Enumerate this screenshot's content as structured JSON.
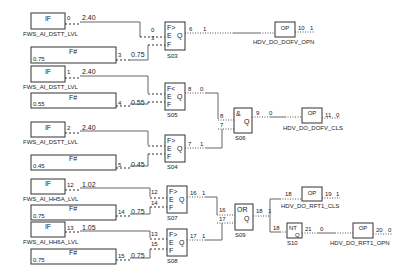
{
  "diagram": {
    "type": "function-block-logic",
    "inputs": [
      {
        "id": "in-if-0",
        "type": "IF",
        "tag": "FWS_AI_DSTT_LVL",
        "signal": "0",
        "value": "2.40"
      },
      {
        "id": "in-fs-3",
        "type": "F#",
        "constant": "0.75",
        "signal": "3",
        "value": "0.75"
      },
      {
        "id": "in-if-1",
        "type": "IF",
        "tag": "FWS_AI_DSTT_LVL",
        "signal": "1",
        "value": "2.40"
      },
      {
        "id": "in-fs-4",
        "type": "F#",
        "constant": "0.55",
        "signal": "4",
        "value": "0.55"
      },
      {
        "id": "in-if-2",
        "type": "IF",
        "tag": "FWS_AI_DSTT_LVL",
        "signal": "2",
        "value": "2.40"
      },
      {
        "id": "in-fs-5",
        "type": "F#",
        "constant": "0.45",
        "signal": "5",
        "value": "0.45"
      },
      {
        "id": "in-if-12",
        "type": "IF",
        "tag": "FWS_AI_HH5A_LVL",
        "signal": "12",
        "value": "1.02"
      },
      {
        "id": "in-fs-14",
        "type": "F#",
        "constant": "0.75",
        "signal": "14",
        "value": "0.75"
      },
      {
        "id": "in-if-13",
        "type": "IF",
        "tag": "FWS_AI_HH6A_LVL",
        "signal": "13",
        "value": "1.05"
      },
      {
        "id": "in-fs-15",
        "type": "F#",
        "constant": "0.75",
        "signal": "15",
        "value": "0.75"
      }
    ],
    "blocks": [
      {
        "id": "S03",
        "label": "S03",
        "lines": [
          "F>",
          "E",
          "F"
        ],
        "q": "Q",
        "in_signals": [
          "0",
          "3"
        ],
        "out_signal": "6",
        "out_value": "1"
      },
      {
        "id": "S05",
        "label": "S05",
        "lines": [
          "F<",
          "E",
          "F"
        ],
        "q": "Q",
        "in_signals": [
          "1",
          "4"
        ],
        "out_signal": "8",
        "out_value": "0"
      },
      {
        "id": "S04",
        "label": "S04",
        "lines": [
          "F>",
          "E",
          "F"
        ],
        "q": "Q",
        "in_signals": [
          "2",
          "5"
        ],
        "out_signal": "7",
        "out_value": "1"
      },
      {
        "id": "S06",
        "label": "S06",
        "lines": [
          "&"
        ],
        "q": "Q",
        "in_signals": [
          "8",
          "7"
        ],
        "out_signal": "9",
        "out_value": "0"
      },
      {
        "id": "S07",
        "label": "S07",
        "lines": [
          "F>",
          "E",
          "F"
        ],
        "q": "Q",
        "in_signals": [
          "12",
          "14"
        ],
        "out_signal": "16",
        "out_value": "1"
      },
      {
        "id": "S08",
        "label": "S08",
        "lines": [
          "F>",
          "E",
          "F"
        ],
        "q": "Q",
        "in_signals": [
          "13",
          "15"
        ],
        "out_signal": "17",
        "out_value": "1"
      },
      {
        "id": "S09",
        "label": "S09",
        "lines": [
          "OR"
        ],
        "q": "Q",
        "in_signals": [
          "16",
          "17"
        ],
        "out_signal": "18",
        "out_value": "1"
      },
      {
        "id": "S10",
        "label": "S10",
        "lines": [
          "NT"
        ],
        "q": "Q",
        "in_signals": [
          "18"
        ],
        "out_signal": "21",
        "out_value": "0"
      }
    ],
    "outputs": [
      {
        "id": "out-10",
        "type": "OP",
        "tag": "HDV_DO_DOFV_OPN",
        "in_signal": "6",
        "signal": "10",
        "value": "1"
      },
      {
        "id": "out-11",
        "type": "OP",
        "tag": "HDV_DO_DOFV_CLS",
        "in_signal": "9",
        "signal": "11",
        "value": "0"
      },
      {
        "id": "out-19",
        "type": "OP",
        "tag": "HDV_DO_RFT1_CLS",
        "in_signal": "18",
        "signal": "19",
        "value": "1"
      },
      {
        "id": "out-20",
        "type": "OP",
        "tag": "HDV_DO_RFT1_OPN",
        "in_signal": "21",
        "signal": "20",
        "value": "0"
      }
    ]
  }
}
